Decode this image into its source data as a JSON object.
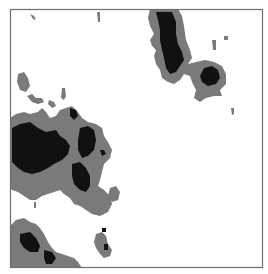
{
  "figure": {
    "type": "binary-phase-map",
    "frame": {
      "x": 10,
      "y": 9,
      "width": 253,
      "height": 259
    },
    "colors": {
      "background": "#ffffff",
      "frame": "#6e6e6e",
      "gray_phase": "#7a7a7a",
      "black_phase": "#111111"
    }
  }
}
